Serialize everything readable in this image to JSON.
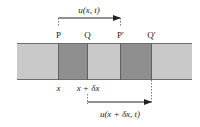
{
  "diagram": {
    "type": "displacement-of-bar-element",
    "colors": {
      "bar_light": "#c9c9c9",
      "bar_dark": "#8f8f8f",
      "bar_edge": "#6e6e6e",
      "ink": "#222222"
    },
    "top_arrow_label": "u(x, t)",
    "bottom_arrow_label": "u(x + δx, t)",
    "points": [
      {
        "id": "P",
        "label": "P"
      },
      {
        "id": "Q",
        "label": "Q"
      },
      {
        "id": "P_prime",
        "label": "P′"
      },
      {
        "id": "Q_prime",
        "label": "Q′"
      }
    ],
    "axis_labels": {
      "x": "x",
      "x_plus_dx": "x + δx"
    }
  }
}
